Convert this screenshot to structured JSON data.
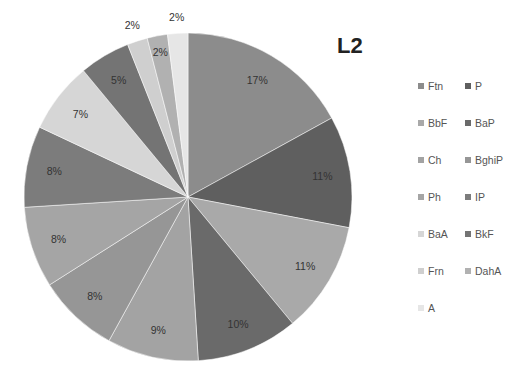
{
  "chart_data": {
    "type": "pie",
    "title": "L2",
    "categories": [
      "Ftn",
      "P",
      "BbF",
      "BaP",
      "Ch",
      "BghiP",
      "Ph",
      "IP",
      "BaA",
      "BkF",
      "Frn",
      "DahA",
      "A"
    ],
    "values": [
      17,
      11,
      11,
      10,
      9,
      8,
      8,
      8,
      7,
      5,
      2,
      2,
      2
    ],
    "value_labels": [
      "17%",
      "11%",
      "11%",
      "10%",
      "9%",
      "8%",
      "8%",
      "8%",
      "7%",
      "5%",
      "2%",
      "2%",
      "2%"
    ],
    "colors": [
      "#8c8c8c",
      "#5f5f5f",
      "#a9a9a9",
      "#6a6a6a",
      "#a3a3a3",
      "#969696",
      "#a5a5a5",
      "#7c7c7c",
      "#d6d6d6",
      "#747474",
      "#cfcfcf",
      "#b1b1b1",
      "#e6e6e6"
    ],
    "start_angle_deg": 0,
    "direction": "clockwise",
    "legend_position": "right",
    "legend_columns": 2
  }
}
